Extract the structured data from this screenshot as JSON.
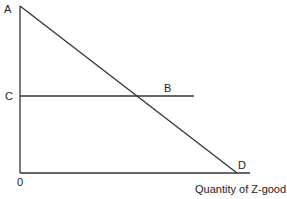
{
  "diagram": {
    "labels": {
      "A": "A",
      "B": "B",
      "C": "C",
      "D": "D",
      "origin": "0",
      "x_axis": "Quantity of Z-good"
    },
    "colors": {
      "line": "#333333",
      "text": "#222222"
    },
    "geometry": {
      "y_axis": {
        "x": 20,
        "y_top": 6,
        "y_bottom": 173
      },
      "x_axis": {
        "y": 173,
        "x_left": 20,
        "x_right": 250
      },
      "demand_line": {
        "from": "A",
        "to": "D",
        "x1": 20,
        "y1": 6,
        "x2": 237,
        "y2": 173
      },
      "horizontal_line": {
        "from": "C",
        "through": "B",
        "y": 96,
        "x1": 20,
        "x2": 194
      }
    }
  }
}
